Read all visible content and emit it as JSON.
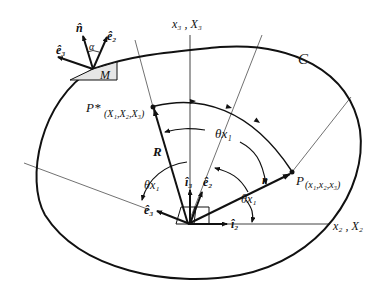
{
  "diagram": {
    "curve_label": "C",
    "point_M_label": "M",
    "axes": {
      "vertical": "x₃ , X₃",
      "horizontal": "x₂ , X₂"
    },
    "unit_vectors": {
      "n_hat": "n̂",
      "alpha": "α",
      "e1_hat_top": "ê₂",
      "e3_hat_top": "ê₃",
      "i3_hat": "î₃",
      "e2_hat": "ê₂",
      "e3_hat": "ê₃",
      "i2_hat": "î₂"
    },
    "points": {
      "P_star": "P*",
      "P_star_coords": "(X₁,X₂,X₃)",
      "P": "P",
      "P_coords": "(x₁,x₂,x₃)"
    },
    "vectors": {
      "R": "R",
      "r": "r"
    },
    "angles": {
      "theta_top": "θx₁",
      "theta_left": "θx₁",
      "theta_right": "θx₁"
    }
  }
}
